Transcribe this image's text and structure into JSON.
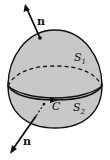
{
  "figure": {
    "colors": {
      "surface_fill": "#c8c8c8",
      "stroke": "#111111",
      "background": "#ffffff"
    },
    "labels": {
      "normal_top": "n",
      "normal_bottom": "n",
      "surface_top": "S",
      "surface_top_sub": "1",
      "surface_bottom": "S",
      "surface_bottom_sub": "2",
      "curve": "C"
    },
    "elements": [
      "upper surface S1 (dome, normal pointing up-left outward)",
      "lower surface S2 (bowl, normal pointing down-left outward)",
      "shared boundary curve C with orientation arrow",
      "dashed back half of boundary curve"
    ]
  }
}
